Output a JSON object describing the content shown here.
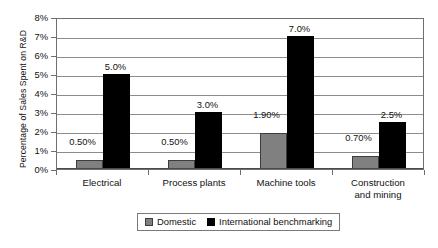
{
  "chart_data": {
    "type": "bar",
    "title": "",
    "subtitle": "",
    "xlabel": "",
    "ylabel": "Percentage of Sales Spent on R&D",
    "ylim": [
      0,
      8
    ],
    "y_tick_labels": [
      "8%",
      "7%",
      "6%",
      "5%",
      "4%",
      "3%",
      "2%",
      "1%",
      "0%"
    ],
    "y_tick_values": [
      8,
      7,
      6,
      5,
      4,
      3,
      2,
      1,
      0
    ],
    "grid": "horizontal",
    "legend_position": "bottom",
    "categories": [
      "Electrical",
      "Process plants",
      "Machine tools",
      "Construction\nand mining"
    ],
    "series": [
      {
        "name": "Domestic",
        "color": "#808080",
        "values": [
          0.5,
          0.5,
          1.9,
          0.7
        ],
        "data_labels": [
          "0.50%",
          "0.50%",
          "1.90%",
          "0.70%"
        ]
      },
      {
        "name": "International benchmarking",
        "color": "#000000",
        "values": [
          5.0,
          3.0,
          7.0,
          2.5
        ],
        "data_labels": [
          "5.0%",
          "3.0%",
          "7.0%",
          "2.5%"
        ]
      }
    ]
  },
  "legend": {
    "items": [
      {
        "label": "Domestic",
        "color": "#808080"
      },
      {
        "label": "International benchmarking",
        "color": "#000000"
      }
    ]
  }
}
